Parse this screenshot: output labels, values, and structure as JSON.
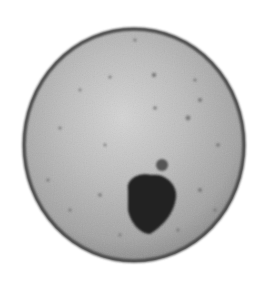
{
  "image": {
    "description": "Grayscale micrograph of a round cell/oocyte with a dark inclusion near the lower center",
    "background": "#ffffff",
    "cell": {
      "cx": 134,
      "cy": 145,
      "rx": 111,
      "ry": 117,
      "fill_center": "#cfcfcf",
      "fill_edge": "#9a9a9a",
      "rim_color": "#4a4a4a"
    },
    "inclusion": {
      "color": "#222222",
      "bud_color": "#555555"
    }
  }
}
